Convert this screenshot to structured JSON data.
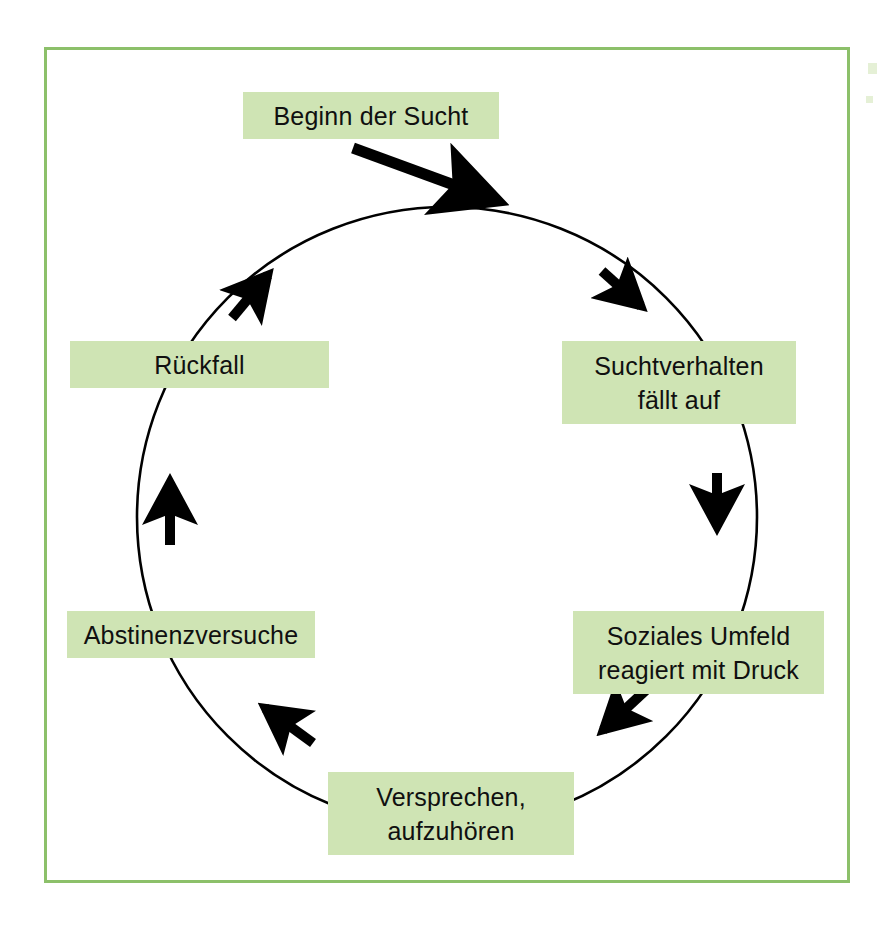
{
  "diagram": {
    "type": "cycle",
    "direction": "clockwise",
    "border_color": "#8cc06a",
    "node_fill_color": "#cfe4b4",
    "text_color": "#101010",
    "line_color": "#000000",
    "background_color": "#ffffff",
    "nodes": [
      {
        "id": "node-0",
        "label": "Beginn der Sucht",
        "line1": "Beginn der Sucht",
        "line2": "",
        "position": "top",
        "angle_deg": 270
      },
      {
        "id": "node-1",
        "label": "Suchtverhalten fällt auf",
        "line1": "Suchtverhalten",
        "line2": "fällt auf",
        "position": "upper-right",
        "angle_deg": 330
      },
      {
        "id": "node-2",
        "label": "Soziales Umfeld reagiert mit Druck",
        "line1": "Soziales Umfeld",
        "line2": "reagiert mit Druck",
        "position": "lower-right",
        "angle_deg": 30
      },
      {
        "id": "node-3",
        "label": "Versprechen, aufzuhören",
        "line1": "Versprechen,",
        "line2": "aufzuhören",
        "position": "bottom",
        "angle_deg": 90
      },
      {
        "id": "node-4",
        "label": "Abstinenzversuche",
        "line1": "Abstinenzversuche",
        "line2": "",
        "position": "lower-left",
        "angle_deg": 150
      },
      {
        "id": "node-5",
        "label": "Rückfall",
        "line1": "Rückfall",
        "line2": "",
        "position": "upper-left",
        "angle_deg": 210
      }
    ],
    "entry_arrow": {
      "from": "Beginn der Sucht",
      "to": "circle-top",
      "description": "straight arrow from the Beginn der Sucht box down-right onto the ring"
    },
    "ring_arrows": [
      {
        "index": 0,
        "between": [
          "Beginn der Sucht",
          "Suchtverhalten fällt auf"
        ],
        "angle_deg": 305
      },
      {
        "index": 1,
        "between": [
          "Suchtverhalten fällt auf",
          "Soziales Umfeld reagiert mit Druck"
        ],
        "angle_deg": 0
      },
      {
        "index": 2,
        "between": [
          "Soziales Umfeld reagiert mit Druck",
          "Versprechen, aufzuhören"
        ],
        "angle_deg": 58
      },
      {
        "index": 3,
        "between": [
          "Versprechen, aufzuhören",
          "Abstinenzversuche"
        ],
        "angle_deg": 122
      },
      {
        "index": 4,
        "between": [
          "Abstinenzversuche",
          "Rückfall"
        ],
        "angle_deg": 180
      },
      {
        "index": 5,
        "between": [
          "Rückfall",
          "Beginn der Sucht"
        ],
        "angle_deg": 235
      }
    ]
  }
}
